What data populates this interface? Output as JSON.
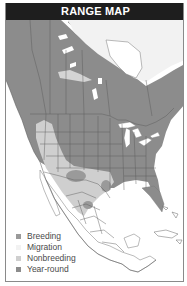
{
  "header": {
    "title": "RANGE MAP"
  },
  "map": {
    "region": "North America",
    "colors": {
      "breeding": "#9a9a9a",
      "migration": "#f2f2f2",
      "nonbreeding": "#cfcfcf",
      "year_round": "#8c8c8c",
      "unoccupied_land": "#ffffff",
      "borders": "#555555",
      "water": "#ffffff"
    }
  },
  "legend": {
    "items": [
      {
        "label": "Breeding",
        "color": "#9a9a9a"
      },
      {
        "label": "Migration",
        "color": "#f2f2f2"
      },
      {
        "label": "Nonbreeding",
        "color": "#cfcfcf"
      },
      {
        "label": "Year-round",
        "color": "#8c8c8c"
      }
    ]
  }
}
